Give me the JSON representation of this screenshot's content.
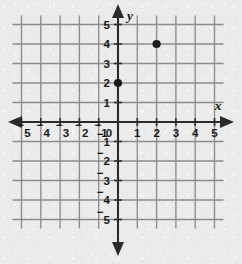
{
  "figure": {
    "kind": "cartesian-coordinate-plane",
    "background_color": "#ebebeb",
    "grid_color": "#8c8c8c",
    "axis_color": "#2b2b2b",
    "point_color": "#1a1a1a",
    "label_color": "#1a1a1a"
  },
  "axes": {
    "x_label": "x",
    "y_label": "y",
    "origin_label": "0",
    "x_min": -5,
    "x_max": 5,
    "y_min": -5,
    "y_max": 5,
    "step": 1,
    "grid": true,
    "arrows": [
      "left",
      "right",
      "up",
      "down"
    ],
    "negative_sign": "−"
  },
  "x_ticks": [
    {
      "value": -5,
      "sign": "−",
      "digit": "5"
    },
    {
      "value": -4,
      "sign": "−",
      "digit": "4"
    },
    {
      "value": -3,
      "sign": "−",
      "digit": "3"
    },
    {
      "value": -2,
      "sign": "−",
      "digit": "2"
    },
    {
      "value": -1,
      "sign": "−",
      "digit": "1"
    },
    {
      "value": 1,
      "sign": "",
      "digit": "1"
    },
    {
      "value": 2,
      "sign": "",
      "digit": "2"
    },
    {
      "value": 3,
      "sign": "",
      "digit": "3"
    },
    {
      "value": 4,
      "sign": "",
      "digit": "4"
    },
    {
      "value": 5,
      "sign": "",
      "digit": "5"
    }
  ],
  "y_ticks": [
    {
      "value": 5,
      "sign": "",
      "digit": "5"
    },
    {
      "value": 4,
      "sign": "",
      "digit": "4"
    },
    {
      "value": 3,
      "sign": "",
      "digit": "3"
    },
    {
      "value": 2,
      "sign": "",
      "digit": "2"
    },
    {
      "value": 1,
      "sign": "",
      "digit": "1"
    },
    {
      "value": -1,
      "sign": "−",
      "digit": "1"
    },
    {
      "value": -2,
      "sign": "−",
      "digit": "2"
    },
    {
      "value": -3,
      "sign": "−",
      "digit": "3"
    },
    {
      "value": -4,
      "sign": "−",
      "digit": "4"
    },
    {
      "value": -5,
      "sign": "−",
      "digit": "5"
    }
  ],
  "chart_data": {
    "type": "scatter",
    "title": "",
    "xlabel": "x",
    "ylabel": "y",
    "xlim": [
      -5,
      5
    ],
    "ylim": [
      -5,
      5
    ],
    "grid": true,
    "legend": "none",
    "series": [
      {
        "name": "plotted-points",
        "marker": "filled-circle",
        "color": "#1a1a1a",
        "points": [
          {
            "x": 0,
            "y": 2
          },
          {
            "x": 2,
            "y": 4
          }
        ]
      }
    ]
  }
}
